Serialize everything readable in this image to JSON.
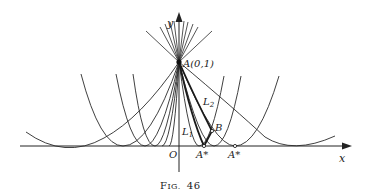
{
  "figure": {
    "caption": "Fig. 46",
    "caption_prefix": "F",
    "caption_smallcaps": "IG.",
    "caption_number": "46",
    "axes": {
      "x_label": "x",
      "y_label": "y",
      "origin_label": "O"
    },
    "points": {
      "A": "A(0,1)",
      "B": "B",
      "A_star_1": "A*",
      "A_star_2": "A*"
    },
    "curve_labels": {
      "L1": "L",
      "L1_sub": "1",
      "L2": "L",
      "L2_sub": "2"
    }
  }
}
